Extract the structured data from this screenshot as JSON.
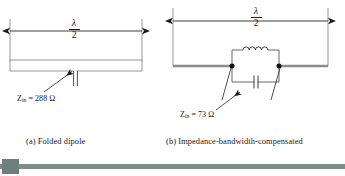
{
  "figure": {
    "background_color": "#ffffff",
    "line_color": "#1a1a1a",
    "wire_color": "#8c8c8c",
    "panels": [
      {
        "id": "panel-a",
        "caption": "(a) Folded dipole",
        "dimension": {
          "numerator": "λ",
          "denominator": "2"
        },
        "impedance": {
          "symbol": "Z",
          "subscript": "in",
          "equals": "=",
          "value": "288",
          "unit": "Ω",
          "full_text": "Zin = 288 Ω"
        },
        "element_type": "folded-dipole-loop",
        "feed": "center-gap-two-terminal"
      },
      {
        "id": "panel-b",
        "caption": "(b) Impedance-bandwidth-compensated",
        "dimension": {
          "numerator": "λ",
          "denominator": "2"
        },
        "impedance": {
          "symbol": "Z",
          "subscript": "in",
          "equals": "=",
          "value": "73",
          "unit": "Ω",
          "full_text": "Zin = 73 Ω"
        },
        "element_type": "straight-dipole-with-parallel-lc-tank",
        "components": [
          {
            "name": "inductor",
            "symbol": "coil",
            "position": "top-branch",
            "humps": 4
          },
          {
            "name": "capacitor",
            "symbol": "parallel-plates",
            "position": "bottom-branch"
          }
        ],
        "junction_dots": 2
      }
    ]
  },
  "scrollbar": {
    "orientation": "horizontal",
    "track_color": "#7e8c8c",
    "thumb_color": "#6f7d7d",
    "thumb_position": "left"
  }
}
